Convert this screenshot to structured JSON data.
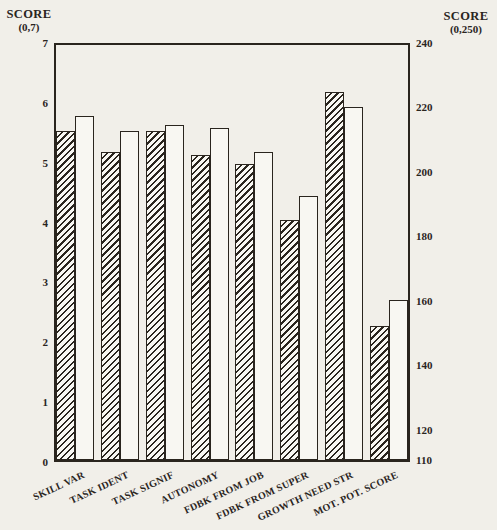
{
  "colors": {
    "paper": "#f1efe9",
    "ink": "#2a251e",
    "bar_fill": "#f8f7f2"
  },
  "left_axis": {
    "title": "SCORE",
    "range_label": "(0,7)",
    "min": 0,
    "max": 7,
    "ticks": [
      7,
      6,
      5,
      4,
      3,
      2,
      1,
      0
    ]
  },
  "right_axis": {
    "title": "SCORE",
    "range_label": "(0,250)",
    "min": 110,
    "max": 240,
    "ticks": [
      240,
      220,
      200,
      180,
      160,
      140,
      120
    ],
    "bottom_tick": 110
  },
  "chart_data": {
    "type": "bar",
    "grouping": "paired",
    "grid": false,
    "legend": "none",
    "categories": [
      "SKILL VAR",
      "TASK IDENT",
      "TASK SIGNIF",
      "AUTONOMY",
      "FDBK FROM JOB",
      "FDBK FROM SUPER",
      "GROWTH NEED STR",
      "MOT. POT. SCORE"
    ],
    "category_axis": [
      "left",
      "left",
      "left",
      "left",
      "left",
      "left",
      "left",
      "right"
    ],
    "left_axis_range": [
      0,
      7
    ],
    "right_axis_range": [
      110,
      240
    ],
    "series": [
      {
        "name": "hatched-bars",
        "pattern": "diagonal-hatch",
        "values": [
          5.55,
          5.2,
          5.55,
          5.15,
          5.0,
          4.05,
          6.2,
          152
        ]
      },
      {
        "name": "open-bars",
        "pattern": "plain",
        "values": [
          5.8,
          5.55,
          5.65,
          5.6,
          5.2,
          4.45,
          5.95,
          160
        ]
      }
    ]
  }
}
